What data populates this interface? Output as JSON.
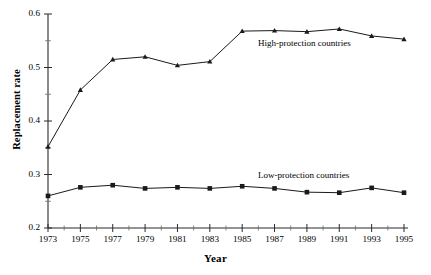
{
  "chart_data": {
    "type": "line",
    "title": "",
    "xlabel": "Year",
    "ylabel": "Replacement rate",
    "x": [
      1973,
      1975,
      1977,
      1979,
      1981,
      1983,
      1985,
      1987,
      1989,
      1991,
      1993,
      1995
    ],
    "xlim": [
      1973,
      1995
    ],
    "ylim": [
      0.2,
      0.6
    ],
    "yticks": [
      0.2,
      0.3,
      0.4,
      0.5,
      0.6
    ],
    "ytick_labels": [
      "0.2",
      "0.3",
      "0.4",
      "0.5",
      "0.6"
    ],
    "yminor_ticks": [
      0.25,
      0.35,
      0.45,
      0.55
    ],
    "xtick_labels": [
      "1973",
      "1975",
      "1977",
      "1979",
      "1981",
      "1983",
      "1985",
      "1987",
      "1989",
      "1991",
      "1993",
      "1995"
    ],
    "xminor_ticks": [
      1974,
      1976,
      1978,
      1980,
      1982,
      1984,
      1986,
      1988,
      1990,
      1992,
      1994
    ],
    "grid": false,
    "legend_position": "inline-annotations",
    "series": [
      {
        "name": "High-protection countries",
        "marker": "triangle",
        "color": "#1a1a1a",
        "values": [
          0.352,
          0.458,
          0.515,
          0.52,
          0.504,
          0.511,
          0.568,
          0.569,
          0.567,
          0.572,
          0.559,
          0.553
        ]
      },
      {
        "name": "Low-protection countries",
        "marker": "square",
        "color": "#1a1a1a",
        "values": [
          0.26,
          0.276,
          0.28,
          0.274,
          0.276,
          0.274,
          0.278,
          0.274,
          0.267,
          0.266,
          0.275,
          0.266
        ]
      }
    ],
    "annotations": [
      {
        "text": "High-protection countries",
        "x_px": 258,
        "y_px": 38
      },
      {
        "text": "Low-protection countries",
        "x_px": 258,
        "y_px": 170
      }
    ]
  },
  "axes": {
    "y_title": "Replacement rate",
    "x_title": "Year"
  }
}
